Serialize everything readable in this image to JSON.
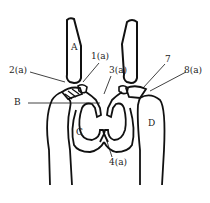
{
  "diagram": {
    "type": "anatomical joint schematic",
    "stroke_color": "#111111",
    "background": "#ffffff",
    "labels": {
      "A": "A",
      "B": "B",
      "C": "C",
      "D": "D",
      "l1a": "1(a)",
      "l2a": "2(a)",
      "l3a": "3(a)",
      "l4a": "4(a)",
      "l7": "7",
      "l8a": "8(a)"
    }
  }
}
